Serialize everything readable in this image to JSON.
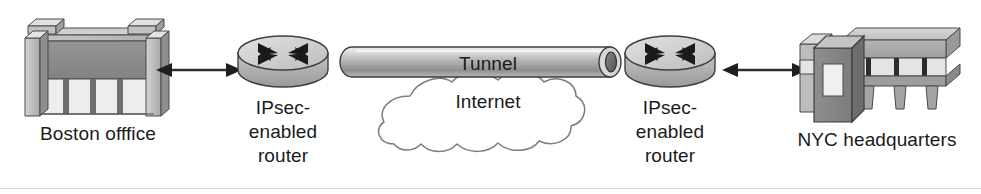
{
  "diagram": {
    "width": 981,
    "height": 194,
    "background_color": "#ffffff",
    "rule_color": "#d9d9d9"
  },
  "nodes": {
    "boston_office": {
      "label": "Boston offfice",
      "icon": "office-building-icon",
      "type": "building"
    },
    "left_router": {
      "label": "IPsec-\nenabled\nrouter",
      "label_lines": [
        "IPsec-",
        "enabled",
        "router"
      ],
      "icon": "router-icon",
      "type": "router"
    },
    "tunnel": {
      "label": "Tunnel",
      "icon": "tunnel-pipe-icon",
      "type": "pipe"
    },
    "internet": {
      "label": "Internet",
      "icon": "cloud-icon",
      "type": "cloud"
    },
    "right_router": {
      "label": "IPsec-\nenabled\nrouter",
      "label_lines": [
        "IPsec-",
        "enabled",
        "router"
      ],
      "icon": "router-icon",
      "type": "router"
    },
    "nyc_headquarters": {
      "label": "NYC headquarters",
      "icon": "headquarters-building-icon",
      "type": "building"
    }
  },
  "connectors": {
    "left_link": {
      "icon": "double-arrow-icon",
      "from": "boston_office",
      "to": "left_router",
      "arrowheads": "both"
    },
    "right_link": {
      "icon": "double-arrow-icon",
      "from": "right_router",
      "to": "nyc_headquarters",
      "arrowheads": "both"
    }
  },
  "colors": {
    "stroke": "#3a3a3a",
    "building_dark": "#8a8a8a",
    "building_mid": "#a8a8a8",
    "building_light": "#c9c9c9",
    "building_panel": "#ededed",
    "pipe_light": "#e2e2e2",
    "pipe_mid": "#a5a5a5",
    "pipe_dark": "#6d6d6d",
    "cloud_fill": "#ffffff",
    "cloud_stroke": "#808080",
    "text": "#1a1a1a"
  }
}
